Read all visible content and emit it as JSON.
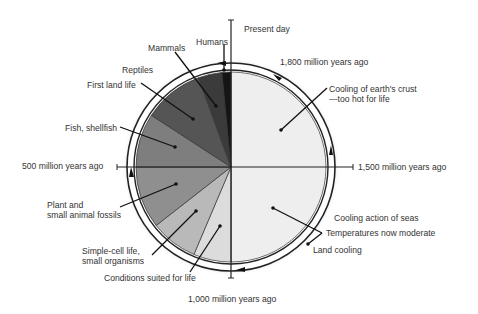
{
  "diagram": {
    "center": [
      231,
      167
    ],
    "inner_radius": 95,
    "ring_inner_radius": 97,
    "ring_outer_radius": 104,
    "wedges": [
      {
        "name": "earliest-cooling",
        "start_deg": 0,
        "end_deg": 180,
        "color": "#eeeeee"
      },
      {
        "name": "conditions-suited",
        "start_deg": 180,
        "end_deg": 203,
        "color": "#dcdcdc"
      },
      {
        "name": "simple-cell",
        "start_deg": 203,
        "end_deg": 232,
        "color": "#b9b9b9"
      },
      {
        "name": "plant-fossils",
        "start_deg": 232,
        "end_deg": 270,
        "color": "#8f8f8f"
      },
      {
        "name": "fish-shellfish",
        "start_deg": 270,
        "end_deg": 303,
        "color": "#7e7e7e"
      },
      {
        "name": "first-land-life",
        "start_deg": 303,
        "end_deg": 340,
        "color": "#555555"
      },
      {
        "name": "mammals",
        "start_deg": 340,
        "end_deg": 354.5,
        "color": "#3b3b3b"
      },
      {
        "name": "humans",
        "start_deg": 354.5,
        "end_deg": 360,
        "color": "#151515"
      }
    ],
    "time_markers": [
      {
        "label": "Present day",
        "x": 244,
        "y": 24
      },
      {
        "label": "1,800 million years ago",
        "x": 280,
        "y": 57
      },
      {
        "label": "1,500 million years ago",
        "x": 358,
        "y": 162
      },
      {
        "label": "1,000 million years ago",
        "x": 188,
        "y": 294
      },
      {
        "label": "500 million years ago",
        "x": 22,
        "y": 161
      }
    ],
    "labels": [
      {
        "text": "Humans",
        "x": 196,
        "y": 37
      },
      {
        "text": "Mammals",
        "x": 148,
        "y": 43
      },
      {
        "text": "Reptiles",
        "x": 122,
        "y": 65
      },
      {
        "text": "First land life",
        "x": 87,
        "y": 80
      },
      {
        "text": "Fish, shellfish",
        "x": 65,
        "y": 123
      },
      {
        "text": "Plant and\nsmall animal fossils",
        "x": 47,
        "y": 200
      },
      {
        "text": "Simple-cell life,\nsmall organisms",
        "x": 82,
        "y": 246
      },
      {
        "text": "Conditions suited for life",
        "x": 104,
        "y": 273
      },
      {
        "text": "Cooling of earth's crust\n—too hot for life",
        "x": 329,
        "y": 84
      },
      {
        "text": "Cooling action of seas",
        "x": 334,
        "y": 213
      },
      {
        "text": "Temperatures now moderate",
        "x": 326,
        "y": 228
      },
      {
        "text": "Land cooling",
        "x": 313,
        "y": 245
      }
    ],
    "leaders": [
      {
        "from": [
          224,
          44
        ],
        "to": [
          224,
          70
        ]
      },
      {
        "from": [
          175,
          52
        ],
        "to": [
          216,
          106
        ]
      },
      {
        "from": [
          141,
          83
        ],
        "to": [
          193,
          119
        ]
      },
      {
        "from": [
          120,
          127
        ],
        "to": [
          175,
          147
        ]
      },
      {
        "from": [
          120,
          207
        ],
        "to": [
          176,
          184
        ]
      },
      {
        "from": [
          152,
          255
        ],
        "to": [
          196,
          211
        ]
      },
      {
        "from": [
          190,
          272
        ],
        "to": [
          220,
          226
        ]
      },
      {
        "from": [
          327,
          88
        ],
        "to": [
          281,
          130
        ]
      },
      {
        "from": [
          322,
          233
        ],
        "to": [
          273,
          208
        ]
      },
      {
        "from": [
          322,
          233
        ],
        "to": [
          308,
          244
        ]
      }
    ]
  }
}
